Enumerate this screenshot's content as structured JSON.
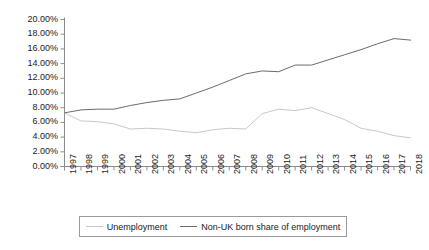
{
  "chart_data": {
    "type": "line",
    "title": "",
    "subtitle": "",
    "xlabel": "",
    "ylabel": "",
    "grid": false,
    "legend_position": "bottom",
    "ylim": [
      0,
      20
    ],
    "ytick_labels": [
      "20.00%",
      "18.00%",
      "16.00%",
      "14.00%",
      "12.00%",
      "10.00%",
      "8.00%",
      "6.00%",
      "4.00%",
      "2.00%",
      "0.00%"
    ],
    "ytick_values": [
      20,
      18,
      16,
      14,
      12,
      10,
      8,
      6,
      4,
      2,
      0
    ],
    "categories": [
      "1997",
      "1998",
      "1999",
      "2000",
      "2001",
      "2002",
      "2003",
      "2004",
      "2005",
      "2006",
      "2007",
      "2008",
      "2009",
      "2010",
      "2011",
      "2012",
      "2013",
      "2014",
      "2015",
      "2016",
      "2017",
      "2018"
    ],
    "series": [
      {
        "name": "Unemployment",
        "color": "#c8c8c8",
        "values": [
          7.3,
          6.2,
          6.1,
          5.8,
          5.1,
          5.2,
          5.1,
          4.8,
          4.6,
          5.0,
          5.2,
          5.1,
          7.2,
          7.8,
          7.6,
          8.0,
          7.2,
          6.4,
          5.2,
          4.8,
          4.2,
          3.9
        ]
      },
      {
        "name": "Non-UK born share of employment",
        "color": "#6b6b6b",
        "values": [
          7.3,
          7.7,
          7.8,
          7.8,
          8.3,
          8.7,
          9.0,
          9.2,
          10.0,
          10.8,
          11.7,
          12.6,
          13.0,
          12.9,
          13.8,
          13.8,
          14.5,
          15.2,
          15.9,
          16.7,
          17.4,
          17.2
        ]
      }
    ]
  },
  "axes": {
    "axis_color": "#8c8c8c"
  },
  "legend": {
    "entries": [
      {
        "label": "Unemployment",
        "color": "#c8c8c8"
      },
      {
        "label": "Non-UK born share of employment",
        "color": "#6b6b6b"
      }
    ]
  }
}
